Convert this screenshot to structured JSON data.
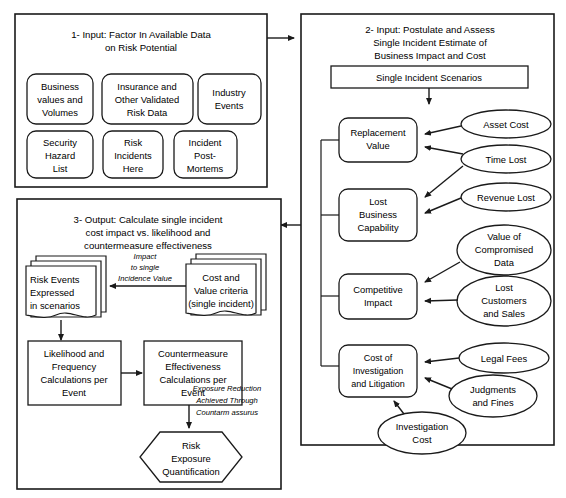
{
  "diagram": {
    "panels": {
      "panel1": {
        "title_lines": [
          "1- Input: Factor In Available Data",
          "on Risk Potential"
        ],
        "nodes": [
          {
            "id": "business-values",
            "lines": [
              "Business",
              "values and",
              "Volumes"
            ]
          },
          {
            "id": "insurance-data",
            "lines": [
              "Insurance and",
              "Other Validated",
              "Risk Data"
            ]
          },
          {
            "id": "industry-events",
            "lines": [
              "Industry",
              "Events"
            ]
          },
          {
            "id": "security-hazard-list",
            "lines": [
              "Security",
              "Hazard",
              "List"
            ]
          },
          {
            "id": "risk-incidents-here",
            "lines": [
              "Risk",
              "Incidents",
              "Here"
            ]
          },
          {
            "id": "incident-post-mortems",
            "lines": [
              "Incident",
              "Post-",
              "Mortems"
            ]
          }
        ]
      },
      "panel2": {
        "title_lines": [
          "2- Input: Postulate and Assess",
          "Single Incident Estimate of",
          "Business Impact and Cost"
        ],
        "header_box": {
          "id": "single-incident-scenarios",
          "label": "Single Incident Scenarios"
        },
        "categories": [
          {
            "id": "replacement-value",
            "lines": [
              "Replacement",
              "Value"
            ]
          },
          {
            "id": "lost-business-capability",
            "lines": [
              "Lost",
              "Business",
              "Capability"
            ]
          },
          {
            "id": "competitive-impact",
            "lines": [
              "Competitive",
              "Impact"
            ]
          },
          {
            "id": "cost-of-investigation",
            "lines": [
              "Cost of",
              "Investigation",
              "and Litigation"
            ]
          }
        ],
        "drivers": [
          {
            "id": "asset-cost",
            "lines": [
              "Asset Cost"
            ],
            "target": "replacement-value"
          },
          {
            "id": "time-lost",
            "lines": [
              "Time Lost"
            ],
            "target": "replacement-value, lost-business-capability"
          },
          {
            "id": "revenue-lost",
            "lines": [
              "Revenue Lost"
            ],
            "target": "lost-business-capability"
          },
          {
            "id": "value-of-compromised-data",
            "lines": [
              "Value of",
              "Compromised",
              "Data"
            ],
            "target": "competitive-impact"
          },
          {
            "id": "lost-customers-and-sales",
            "lines": [
              "Lost",
              "Customers",
              "and Sales"
            ],
            "target": "competitive-impact"
          },
          {
            "id": "legal-fees",
            "lines": [
              "Legal Fees"
            ],
            "target": "cost-of-investigation"
          },
          {
            "id": "judgments-and-fines",
            "lines": [
              "Judgments",
              "and Fines"
            ],
            "target": "cost-of-investigation"
          },
          {
            "id": "investigation-cost",
            "lines": [
              "Investigation",
              "Cost"
            ],
            "target": "cost-of-investigation"
          }
        ]
      },
      "panel3": {
        "title_lines": [
          "3- Output: Calculate single incident",
          "cost impact vs. likelihood and",
          "countermeasure effectiveness"
        ],
        "documents": [
          {
            "id": "risk-events-doc",
            "lines": [
              "Risk Events",
              "Expressed",
              "in scenarios"
            ]
          },
          {
            "id": "cost-value-criteria-doc",
            "lines": [
              "Cost and",
              "Value criteria",
              "(single incident)"
            ]
          }
        ],
        "edge_label_impact": [
          "Impact",
          "to single",
          "Incidence Value"
        ],
        "processes": [
          {
            "id": "likelihood-frequency",
            "lines": [
              "Likelihood and",
              "Frequency",
              "Calculations per",
              "Event"
            ]
          },
          {
            "id": "countermeasure-effectiveness",
            "lines": [
              "Countermeasure",
              "Effectiveness",
              "Calculations per",
              "Event"
            ]
          }
        ],
        "edge_label_exposure": [
          "Exposure Reduction",
          "Achieved Through",
          "Countarm assurus"
        ],
        "terminal": {
          "id": "risk-exposure-quantification",
          "lines": [
            "Risk",
            "Exposure",
            "Quantification"
          ]
        }
      }
    },
    "colors": {
      "stroke": "#1a1a1a",
      "fill": "#ffffff",
      "text": "#000000"
    }
  }
}
